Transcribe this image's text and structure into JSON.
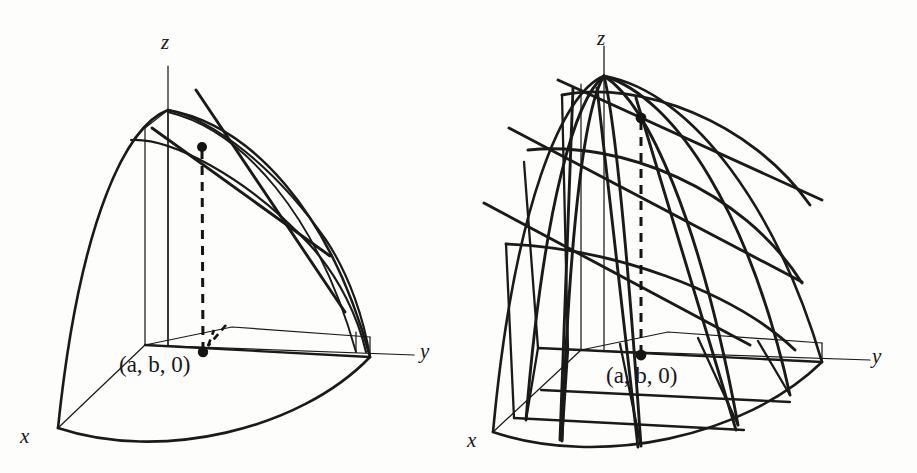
{
  "figure": {
    "domain": "Diagram",
    "background_color": "#fdfdfc",
    "ink_color": "#1a1a18",
    "panels": [
      {
        "id": "left",
        "name": "tangent-lines-panel",
        "axes": {
          "x_label": "x",
          "y_label": "y",
          "z_label": "z"
        },
        "point_label": {
          "open_paren": "(",
          "a": "a",
          "comma1": ", ",
          "b": "b",
          "comma2": ", ",
          "zero": "0",
          "close_paren": ")",
          "full": "(a, b, 0)"
        },
        "markers": [
          {
            "name": "surface-point",
            "x": 202,
            "y": 147
          },
          {
            "name": "base-point",
            "x": 203,
            "y": 352
          }
        ],
        "tangent_line_count": 2,
        "dashed_drop_line": true
      },
      {
        "id": "right",
        "name": "coordinate-curves-panel",
        "axes": {
          "x_label": "x",
          "y_label": "y",
          "z_label": "z"
        },
        "point_label": {
          "open_paren": "(",
          "a": "a",
          "comma1": ", ",
          "b": "b",
          "comma2": ", ",
          "zero": "0",
          "close_paren": ")",
          "full": "(a, b, 0)"
        },
        "markers": [
          {
            "name": "surface-point",
            "x": 191,
            "y": 118
          },
          {
            "name": "base-point",
            "x": 191,
            "y": 355
          }
        ],
        "tangent_line_count": 6,
        "latitude_curve_count": 3,
        "longitude_curve_count": 3,
        "dashed_drop_line": true
      }
    ]
  }
}
